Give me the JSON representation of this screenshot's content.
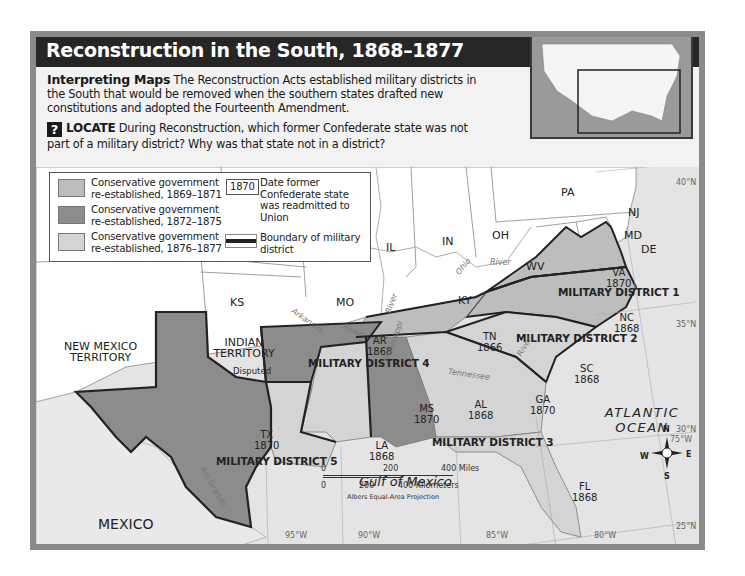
{
  "title": "Reconstruction in the South, 1868–1877",
  "intro": {
    "label": "Interpreting Maps",
    "text": "The Reconstruction Acts established military districts in the South that would be removed when the southern states drafted new constitutions and adopted the Fourteenth Amendment."
  },
  "locate": {
    "icon": "?",
    "label": "LOCATE",
    "text": "During Reconstruction, which former Confederate state was not part of a military district? Why was that state not in a district?"
  },
  "colors": {
    "title_bar": "#262626",
    "period_1869_1871": "#bdbdbd",
    "period_1872_1875": "#8c8c8c",
    "period_1876_1877": "#d4d4d4",
    "union_states": "#ffffff",
    "water": "#e4e4e4",
    "district_boundary": "#222222"
  },
  "legend": {
    "items": [
      {
        "label_line1": "Conservative government",
        "label_line2": "re-established, 1869–1871",
        "color": "#bdbdbd"
      },
      {
        "label_line1": "Conservative government",
        "label_line2": "re-established, 1872–1875",
        "color": "#8c8c8c"
      },
      {
        "label_line1": "Conservative government",
        "label_line2": "re-established, 1876–1877",
        "color": "#d4d4d4"
      }
    ],
    "date_sample": "1870",
    "date_text": "Date former Confederate state was readmitted to Union",
    "boundary_text": "Boundary of military district"
  },
  "states": [
    {
      "abbr": "VA",
      "year": "1870"
    },
    {
      "abbr": "NC",
      "year": "1868"
    },
    {
      "abbr": "SC",
      "year": "1868"
    },
    {
      "abbr": "GA",
      "year": "1870"
    },
    {
      "abbr": "FL",
      "year": "1868"
    },
    {
      "abbr": "AL",
      "year": "1868"
    },
    {
      "abbr": "MS",
      "year": "1870"
    },
    {
      "abbr": "LA",
      "year": "1868"
    },
    {
      "abbr": "AR",
      "year": "1868"
    },
    {
      "abbr": "TN",
      "year": "1866"
    },
    {
      "abbr": "TX",
      "year": "1870"
    }
  ],
  "other_regions": [
    "PA",
    "NJ",
    "MD",
    "DE",
    "OH",
    "IN",
    "IL",
    "WV",
    "KY",
    "MO",
    "KS",
    "INDIAN TERRITORY",
    "NEW MEXICO TERRITORY",
    "MEXICO"
  ],
  "annotations": {
    "disputed": "Disputed"
  },
  "districts": [
    "MILITARY DISTRICT 1",
    "MILITARY DISTRICT 2",
    "MILITARY DISTRICT 3",
    "MILITARY DISTRICT 4",
    "MILITARY DISTRICT 5"
  ],
  "water": {
    "atlantic": "ATLANTIC OCEAN",
    "gulf": "Gulf of Mexico"
  },
  "rivers": [
    "Ohio",
    "River",
    "Mississippi",
    "River",
    "Arkansas",
    "River",
    "Tennessee",
    "River",
    "Rio Grande"
  ],
  "coordinates": {
    "lat": [
      "40°N",
      "35°N",
      "30°N",
      "25°N"
    ],
    "lon": [
      "95°W",
      "90°W",
      "85°W",
      "80°W",
      "75°W"
    ]
  },
  "compass": {
    "n": "N",
    "s": "S",
    "e": "E",
    "w": "W"
  },
  "scale": {
    "miles_zero": "0",
    "miles_mid": "200",
    "miles_end": "400 Miles",
    "km_zero": "0",
    "km_mid": "200",
    "km_end": "400 Kilometers",
    "projection": "Albers Equal-Area Projection"
  }
}
